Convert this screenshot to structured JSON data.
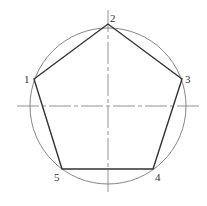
{
  "diagram": {
    "circle": {
      "cx": 108,
      "cy": 106,
      "r": 78,
      "stroke": "#777777"
    },
    "centerlines": {
      "horizontal": {
        "x1": 17,
        "y1": 106,
        "x2": 199,
        "y2": 106
      },
      "vertical": {
        "x1": 108,
        "y1": 10,
        "x2": 108,
        "y2": 193
      },
      "stroke": "#888888"
    },
    "pentagon": {
      "stroke": "#333333",
      "vertices": [
        {
          "label": "1",
          "x": 34,
          "y": 79,
          "lx": 24,
          "ly": 83
        },
        {
          "label": "2",
          "x": 108,
          "y": 24,
          "lx": 110,
          "ly": 22
        },
        {
          "label": "3",
          "x": 182,
          "y": 79,
          "lx": 185,
          "ly": 83
        },
        {
          "label": "4",
          "x": 153,
          "y": 169,
          "lx": 155,
          "ly": 181
        },
        {
          "label": "5",
          "x": 62,
          "y": 169,
          "lx": 54,
          "ly": 181
        }
      ]
    }
  }
}
